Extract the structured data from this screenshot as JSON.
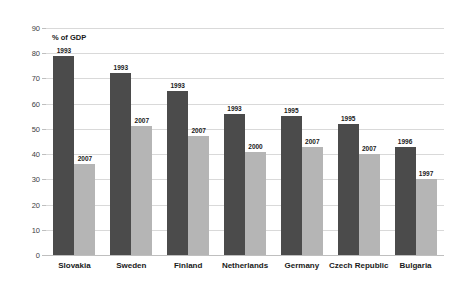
{
  "chart_data": {
    "type": "bar",
    "title": "",
    "subtitle": "",
    "xlabel": "",
    "ylabel": "% of GDP",
    "ylim": [
      0,
      90
    ],
    "ytick_values": [
      0,
      10,
      20,
      30,
      40,
      50,
      60,
      70,
      80,
      90
    ],
    "ytick_labels": [
      "0",
      "10",
      "20",
      "30",
      "40",
      "50",
      "60",
      "70",
      "80",
      "90"
    ],
    "grid": true,
    "legend": "none",
    "categories": [
      "Slovakia",
      "Sweden",
      "Finland",
      "Netherlands",
      "Germany",
      "Czech Republic",
      "Bulgaria"
    ],
    "series": [
      {
        "name": "earlier year",
        "color": "#4b4b4b",
        "values": [
          79,
          72,
          65,
          56,
          55,
          52,
          43
        ],
        "point_labels": [
          "1993",
          "1993",
          "1993",
          "1993",
          "1995",
          "1995",
          "1996"
        ]
      },
      {
        "name": "later year",
        "color": "#b5b5b5",
        "values": [
          36,
          51,
          47,
          41,
          43,
          40,
          30
        ],
        "point_labels": [
          "2007",
          "2007",
          "2007",
          "2000",
          "2007",
          "2007",
          "1997"
        ]
      }
    ]
  }
}
